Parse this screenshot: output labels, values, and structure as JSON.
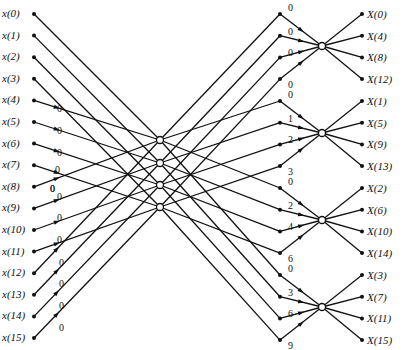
{
  "diagram": {
    "type": "16-point radix-4 FFT flow graph",
    "inputs": [
      "x(0)",
      "x(1)",
      "x(2)",
      "x(3)",
      "x(4)",
      "x(5)",
      "x(6)",
      "x(7)",
      "x(8)",
      "x(9)",
      "x(10)",
      "x(11)",
      "x(12)",
      "x(13)",
      "x(14)",
      "x(15)"
    ],
    "outputs": [
      "X(0)",
      "X(4)",
      "X(8)",
      "X(12)",
      "X(1)",
      "X(5)",
      "X(9)",
      "X(13)",
      "X(2)",
      "X(6)",
      "X(10)",
      "X(14)",
      "X(3)",
      "X(7)",
      "X(11)",
      "X(15)"
    ],
    "stage1_twiddles": [
      "0",
      "0",
      "0",
      "0",
      "0",
      "0",
      "0",
      "0",
      "0",
      "0",
      "0",
      "0"
    ],
    "stage1_extra": "0",
    "stage2_twiddles": [
      [
        "0",
        "0",
        "0",
        "0"
      ],
      [
        "0",
        "1",
        "2",
        "3"
      ],
      [
        "0",
        "2",
        "4",
        "6"
      ],
      [
        "0",
        "3",
        "6",
        "9"
      ]
    ]
  }
}
